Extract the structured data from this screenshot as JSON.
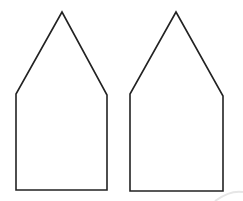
{
  "diagram": {
    "background": "#ffffff",
    "stroke_color": "#222222",
    "stroke_width": 1.6,
    "shapes": [
      {
        "name": "left-house-pentagon",
        "points": "62,12 16,94 16,190 107,190 107,95"
      },
      {
        "name": "right-house-pentagon",
        "points": "176,12 130,94 130,191 223,191 223,96"
      }
    ]
  }
}
